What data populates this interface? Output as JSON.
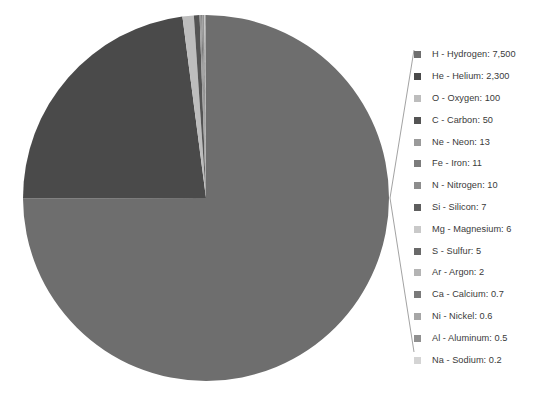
{
  "chart_data": {
    "type": "pie",
    "title": "",
    "subtitle": "",
    "xlabel": "",
    "ylabel": "",
    "grid": false,
    "legend_position": "right",
    "value_unit": "relative abundance",
    "categories": [
      "H - Hydrogen",
      "He - Helium",
      "O - Oxygen",
      "C - Carbon",
      "Ne - Neon",
      "Fe - Iron",
      "N - Nitrogen",
      "Si - Silicon",
      "Mg - Magnesium",
      "S - Sulfur",
      "Ar - Argon",
      "Ca - Calcium",
      "Ni - Nickel",
      "Al - Aluminum",
      "Na - Sodium"
    ],
    "values": [
      7500,
      2300,
      100,
      50,
      13,
      11,
      10,
      7,
      6,
      5,
      2,
      0.7,
      0.6,
      0.5,
      0.2
    ],
    "slice_colors": [
      "#6e6e6e",
      "#4a4a4a",
      "#bdbdbd",
      "#545454",
      "#9a9a9a",
      "#7c7c7c",
      "#8d8d8d",
      "#5e5e5e",
      "#c9c9c9",
      "#696969",
      "#b4b4b4",
      "#7a7a7a",
      "#a6a6a6",
      "#909090",
      "#d4d4d4"
    ]
  },
  "legend": {
    "items": [
      {
        "label": "H - Hydrogen: 7,500",
        "symbol": "H",
        "name": "Hydrogen",
        "value": "7,500",
        "color": "#6e6e6e"
      },
      {
        "label": "He - Helium: 2,300",
        "symbol": "He",
        "name": "Helium",
        "value": "2,300",
        "color": "#4a4a4a"
      },
      {
        "label": "O - Oxygen: 100",
        "symbol": "O",
        "name": "Oxygen",
        "value": "100",
        "color": "#bdbdbd"
      },
      {
        "label": "C - Carbon: 50",
        "symbol": "C",
        "name": "Carbon",
        "value": "50",
        "color": "#545454"
      },
      {
        "label": "Ne - Neon: 13",
        "symbol": "Ne",
        "name": "Neon",
        "value": "13",
        "color": "#9a9a9a"
      },
      {
        "label": "Fe - Iron: 11",
        "symbol": "Fe",
        "name": "Iron",
        "value": "11",
        "color": "#7c7c7c"
      },
      {
        "label": "N - Nitrogen: 10",
        "symbol": "N",
        "name": "Nitrogen",
        "value": "10",
        "color": "#8d8d8d"
      },
      {
        "label": "Si - Silicon: 7",
        "symbol": "Si",
        "name": "Silicon",
        "value": "7",
        "color": "#5e5e5e"
      },
      {
        "label": "Mg - Magnesium: 6",
        "symbol": "Mg",
        "name": "Magnesium",
        "value": "6",
        "color": "#c9c9c9"
      },
      {
        "label": "S - Sulfur: 5",
        "symbol": "S",
        "name": "Sulfur",
        "value": "5",
        "color": "#696969"
      },
      {
        "label": "Ar - Argon: 2",
        "symbol": "Ar",
        "name": "Argon",
        "value": "2",
        "color": "#b4b4b4"
      },
      {
        "label": "Ca - Calcium: 0.7",
        "symbol": "Ca",
        "name": "Calcium",
        "value": "0.7",
        "color": "#7a7a7a"
      },
      {
        "label": "Ni - Nickel: 0.6",
        "symbol": "Ni",
        "name": "Nickel",
        "value": "0.6",
        "color": "#a6a6a6"
      },
      {
        "label": "Al - Aluminum: 0.5",
        "symbol": "Al",
        "name": "Aluminum",
        "value": "0.5",
        "color": "#909090"
      },
      {
        "label": "Na - Sodium: 0.2",
        "symbol": "Na",
        "name": "Sodium",
        "value": "0.2",
        "color": "#d4d4d4"
      }
    ]
  },
  "geometry": {
    "center_x": 206,
    "center_y": 198,
    "radius": 183,
    "start_angle_deg": -90,
    "leader_apex_x": 390,
    "leader_apex_y": 198,
    "leader_top_x": 414,
    "leader_top_y": 50,
    "leader_bottom_x": 414,
    "leader_bottom_y": 352,
    "leader_color": "#8a8a8a"
  }
}
